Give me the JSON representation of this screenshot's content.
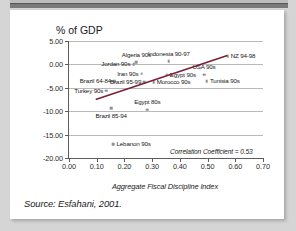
{
  "slide": {
    "source_note": "Source: Esfahani, 2001."
  },
  "chart_data": {
    "type": "scatter",
    "title": "",
    "ylabel": "% of GDP",
    "xlabel": "Aggregate Fiscal Discipline Index",
    "xlim": [
      0.0,
      0.7
    ],
    "ylim": [
      -20.0,
      5.0
    ],
    "grid": true,
    "legend": "none",
    "x_ticks": [
      "0.00",
      "0.10",
      "0.20",
      "0.30",
      "0.40",
      "0.50",
      "0.60",
      "0.70"
    ],
    "x_tick_values": [
      0.0,
      0.1,
      0.2,
      0.3,
      0.4,
      0.5,
      0.6,
      0.7
    ],
    "y_ticks": [
      "5.00",
      "0.00",
      "-5.00",
      "-10.00",
      "-15.00",
      "-20.00"
    ],
    "y_tick_values": [
      5.0,
      0.0,
      -5.0,
      -10.0,
      -15.0,
      -20.0
    ],
    "annotation": "Correlation Coefficient = 0.53",
    "correlation_coefficient": 0.53,
    "marker_color": "#8f8f93",
    "trendline_color": "#7b2036",
    "trendline": {
      "x0": 0.1,
      "y0": -7.5,
      "x1": 0.575,
      "y1": 1.9
    },
    "points": [
      {
        "label": "Turkey 90s",
        "x": 0.135,
        "y": -5.6,
        "label_pos": "r"
      },
      {
        "label": "Brazil 64-84",
        "x": 0.163,
        "y": -3.6,
        "label_pos": "r"
      },
      {
        "label": "Brazil 85-94",
        "x": 0.152,
        "y": -9.4,
        "label_pos": "c-below"
      },
      {
        "label": "Lebanon 90s",
        "x": 0.16,
        "y": -17.0,
        "label_pos": "l"
      },
      {
        "label": "Jordan 90s",
        "x": 0.233,
        "y": 0.0,
        "label_pos": "r"
      },
      {
        "label": "Algeria 90s",
        "x": 0.243,
        "y": 0.5,
        "label_pos": "c-above"
      },
      {
        "label": "Iran 90s",
        "x": 0.262,
        "y": -2.0,
        "label_pos": "r"
      },
      {
        "label": "Brazil 95-99",
        "x": 0.272,
        "y": -3.8,
        "label_pos": "r"
      },
      {
        "label": "Egypt 80s",
        "x": 0.283,
        "y": -9.7,
        "label_pos": "c-above"
      },
      {
        "label": "Morocco 90s",
        "x": 0.305,
        "y": -3.8,
        "label_pos": "l"
      },
      {
        "label": "Egypt 90s",
        "x": 0.352,
        "y": -2.2,
        "label_pos": "l"
      },
      {
        "label": "Indonesia 90-97",
        "x": 0.36,
        "y": 0.7,
        "label_pos": "c-above"
      },
      {
        "label": "USA 90s",
        "x": 0.487,
        "y": -2.2,
        "label_pos": "c-above"
      },
      {
        "label": "Tunisia 90s",
        "x": 0.497,
        "y": -3.6,
        "label_pos": "l"
      },
      {
        "label": "NZ 94-98",
        "x": 0.572,
        "y": 1.8,
        "label_pos": "l"
      }
    ]
  }
}
